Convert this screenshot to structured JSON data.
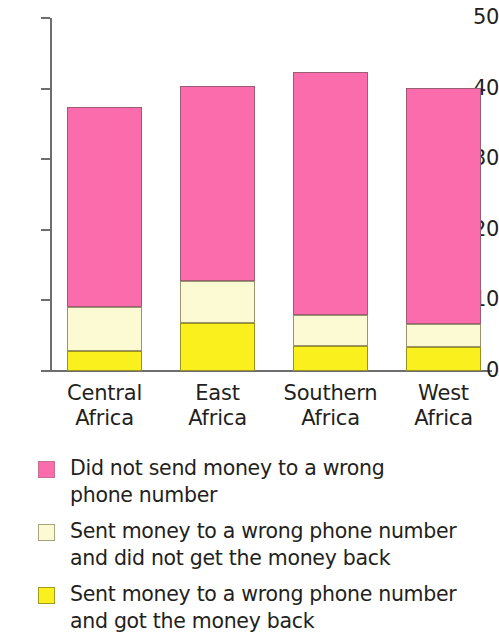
{
  "chart_data": {
    "type": "bar",
    "subtype": "stacked-vertical",
    "title": "",
    "subtitle": "",
    "xlabel": "",
    "ylabel": "",
    "categories": [
      "Central\nAfrica",
      "East\nAfrica",
      "Southern\nAfrica",
      "West\nAfrica"
    ],
    "category_lines": [
      [
        "Central",
        "Africa"
      ],
      [
        "East",
        "Africa"
      ],
      [
        "Southern",
        "Africa"
      ],
      [
        "West",
        "Africa"
      ]
    ],
    "series": [
      {
        "name": "Sent money to a wrong phone number and got the money back",
        "short": "got-money-back",
        "color": "#faf01e",
        "values": [
          2.9,
          6.8,
          3.5,
          3.4
        ]
      },
      {
        "name": "Sent money to a wrong phone number and did not get the money back",
        "short": "did-not-get-money-back",
        "color": "#fbfad2",
        "values": [
          6.2,
          6.0,
          4.5,
          3.2
        ]
      },
      {
        "name": "Did not send money to a wrong phone number",
        "short": "did-not-send",
        "color": "#fa6cac",
        "values": [
          28.3,
          27.5,
          34.3,
          33.5
        ]
      }
    ],
    "stack_totals": [
      37.4,
      40.3,
      42.3,
      40.1
    ],
    "ylim": [
      0,
      50
    ],
    "yticks": [
      0,
      10,
      20,
      30,
      40,
      50
    ],
    "ytick_labels": [
      "0",
      "10",
      "20",
      "30",
      "40",
      "50"
    ],
    "grid": false,
    "legend_position": "bottom-left"
  },
  "axis": {
    "y_labels": [
      "50",
      "40",
      "30",
      "20",
      "10",
      "0"
    ]
  },
  "legend": {
    "items": [
      {
        "label": "Did not send money to a wrong\nphone number",
        "color": "#fa6cac",
        "swatch_class": "sw-pink"
      },
      {
        "label": "Sent money to a wrong phone number\nand did not get the money back",
        "color": "#fbfad2",
        "swatch_class": "sw-cream"
      },
      {
        "label": "Sent money to a wrong phone number\nand got the money back",
        "color": "#faf01e",
        "swatch_class": "sw-yellow"
      }
    ]
  }
}
